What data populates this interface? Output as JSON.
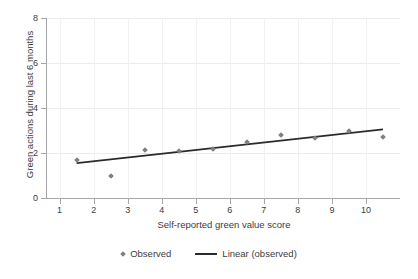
{
  "chart_data": {
    "type": "scatter",
    "title": "",
    "xlabel": "Self-reported green value score",
    "ylabel": "Green actions during last 6 months",
    "xlim": [
      0.6,
      11.0
    ],
    "ylim": [
      0,
      8
    ],
    "xticks": [
      "1",
      "2",
      "3",
      "4",
      "5",
      "6",
      "7",
      "8",
      "9",
      "10"
    ],
    "xtick_values": [
      1,
      2,
      3,
      4,
      5,
      6,
      7,
      8,
      9,
      10
    ],
    "yticks": [
      "0",
      "2",
      "4",
      "6",
      "8"
    ],
    "ytick_values": [
      0,
      2,
      4,
      6,
      8
    ],
    "grid": true,
    "legend_position": "bottom",
    "series": [
      {
        "name": "Observed",
        "type": "scatter",
        "marker": "diamond",
        "color": "#808080",
        "x": [
          1.5,
          2.5,
          3.5,
          4.5,
          5.5,
          6.5,
          7.5,
          8.5,
          9.5,
          10.5
        ],
        "values": [
          1.7,
          1.0,
          2.15,
          2.1,
          2.2,
          2.5,
          2.8,
          2.65,
          3.0,
          2.7
        ]
      },
      {
        "name": "Linear (observed)",
        "type": "line",
        "color": "#2b2b2b",
        "x": [
          1.5,
          10.5
        ],
        "values": [
          1.55,
          3.05
        ]
      }
    ]
  },
  "legend": {
    "items": [
      {
        "label": "Observed",
        "marker": "diamond-marker",
        "color": "#808080"
      },
      {
        "label": "Linear (observed)",
        "marker": "line-marker",
        "color": "#2b2b2b"
      }
    ]
  }
}
